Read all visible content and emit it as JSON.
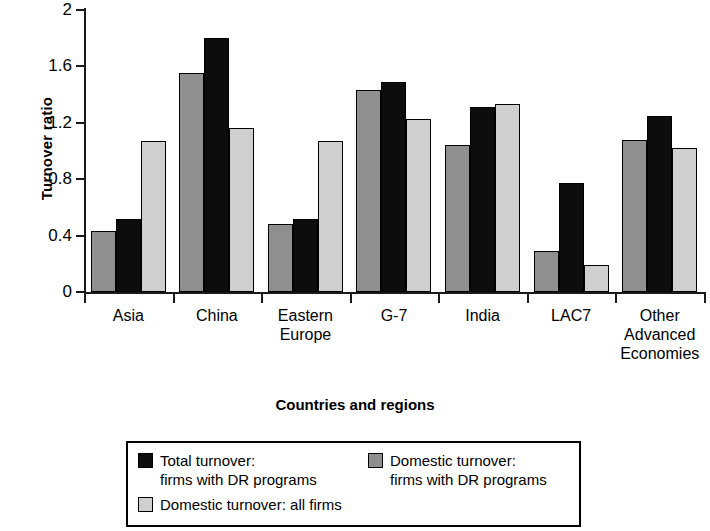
{
  "chart_data": {
    "type": "bar",
    "title": "",
    "xlabel": "Countries and regions",
    "ylabel": "Turnover ratio",
    "ylim": [
      0,
      2
    ],
    "yticks": [
      "0",
      "0.4",
      "0.8",
      "1.2",
      "1.6",
      "2"
    ],
    "ytick_values": [
      0,
      0.4,
      0.8,
      1.2,
      1.6,
      2
    ],
    "grid": false,
    "legend_position": "bottom",
    "categories": [
      "Asia",
      "China",
      "Eastern Europe",
      "G-7",
      "India",
      "LAC7",
      "Other Advanced Economies"
    ],
    "series": [
      {
        "name": "Domestic turnover: firms with DR programs",
        "color": "#8f8f8f",
        "values": [
          0.43,
          1.55,
          0.48,
          1.43,
          1.04,
          0.29,
          1.08
        ]
      },
      {
        "name": "Total turnover: firms with DR programs",
        "color": "#0d0d0d",
        "values": [
          0.52,
          1.8,
          0.52,
          1.49,
          1.31,
          0.77,
          1.25
        ]
      },
      {
        "name": "Domestic turnover: all firms",
        "color": "#cfcfcf",
        "values": [
          1.07,
          1.16,
          1.07,
          1.23,
          1.33,
          0.19,
          1.02
        ]
      }
    ]
  },
  "axes": {
    "y_title": "Turnover ratio",
    "x_title": "Countries and regions",
    "y_ticks": [
      {
        "label": "2"
      },
      {
        "label": "1.6"
      },
      {
        "label": "1.2"
      },
      {
        "label": "0.8"
      },
      {
        "label": "0.4"
      },
      {
        "label": "0"
      }
    ],
    "x_categories": [
      {
        "label": "Asia"
      },
      {
        "label": "China"
      },
      {
        "label": "Eastern\nEurope"
      },
      {
        "label": "G-7"
      },
      {
        "label": "India"
      },
      {
        "label": "LAC7"
      },
      {
        "label": "Other\nAdvanced\nEconomies"
      }
    ]
  },
  "legend": {
    "entries": [
      {
        "swatch": "c-black",
        "label": "Total turnover:\nfirms with DR programs"
      },
      {
        "swatch": "c-dark",
        "label": "Domestic turnover:\nfirms with DR programs"
      },
      {
        "swatch": "c-light",
        "label": "Domestic turnover: all firms"
      }
    ]
  }
}
